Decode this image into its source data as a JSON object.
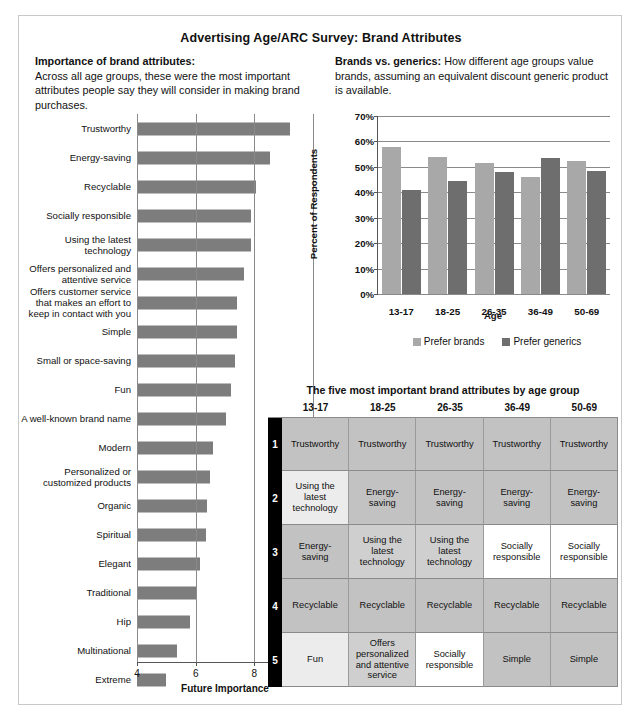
{
  "title": "Advertising Age/ARC Survey: Brand Attributes",
  "left_caption": {
    "lead": "Importance of brand attributes:",
    "body": "Across all age groups, these were the most important attributes people say they will consider in making brand purchases."
  },
  "right_caption": {
    "lead": "Brands vs. generics:",
    "body": " How different age groups value brands, assuming an equivalent discount generic product is available."
  },
  "colors": {
    "bar_gray": "#7d7d7d",
    "prefer_brands": "#a8a8a8",
    "prefer_generics": "#6e6e6e",
    "rank_column": "#000000",
    "grid": "#8a8a8a"
  },
  "chart_data": [
    {
      "type": "bar",
      "orientation": "horizontal",
      "title": "Importance of brand attributes",
      "xlabel": "Future Importance",
      "ylabel": "",
      "xlim": [
        4,
        10
      ],
      "xticks": [
        4,
        6,
        8,
        10
      ],
      "grid": true,
      "categories": [
        "Trustworthy",
        "Energy-saving",
        "Recyclable",
        "Socially responsible",
        "Using the latest\ntechnology",
        "Offers personalized and\nattentive service",
        "Offers customer service\nthat makes an effort to\nkeep in contact with you",
        "Simple",
        "Small or space-saving",
        "Fun",
        "A well-known brand name",
        "Modern",
        "Personalized or\ncustomized products",
        "Organic",
        "Spiritual",
        "Elegant",
        "Traditional",
        "Hip",
        "Multinational",
        "Extreme"
      ],
      "values": [
        9.2,
        8.55,
        8.05,
        7.9,
        7.9,
        7.65,
        7.4,
        7.4,
        7.35,
        7.2,
        7.05,
        6.6,
        6.5,
        6.4,
        6.35,
        6.15,
        6.0,
        5.8,
        5.35,
        5.0
      ]
    },
    {
      "type": "bar",
      "orientation": "vertical",
      "title": "Brands vs. generics",
      "xlabel": "Age",
      "ylabel": "Percent of Respondents",
      "ylim": [
        0,
        70
      ],
      "yticks": [
        "0%",
        "10%",
        "20%",
        "30%",
        "40%",
        "50%",
        "60%",
        "70%"
      ],
      "grid": true,
      "legend_position": "bottom",
      "categories": [
        "13-17",
        "18-25",
        "26-35",
        "36-49",
        "50-69"
      ],
      "series": [
        {
          "name": "Prefer brands",
          "values": [
            58,
            54,
            51.5,
            46,
            52.5
          ]
        },
        {
          "name": "Prefer generics",
          "values": [
            41,
            44.5,
            48,
            53.5,
            48.5
          ]
        }
      ]
    }
  ],
  "table": {
    "title": "The five most important brand attributes by age group",
    "columns": [
      "13-17",
      "18-25",
      "26-35",
      "36-49",
      "50-69"
    ],
    "ranks": [
      "1",
      "2",
      "3",
      "4",
      "5"
    ],
    "rows": [
      [
        {
          "text": "Trustworthy",
          "shade": "sh-dark"
        },
        {
          "text": "Trustworthy",
          "shade": "sh-dark"
        },
        {
          "text": "Trustworthy",
          "shade": "sh-dark"
        },
        {
          "text": "Trustworthy",
          "shade": "sh-dark"
        },
        {
          "text": "Trustworthy",
          "shade": "sh-dark"
        }
      ],
      [
        {
          "text": "Using the\nlatest\ntechnology",
          "shade": "sh-light"
        },
        {
          "text": "Energy-\nsaving",
          "shade": "sh-dark"
        },
        {
          "text": "Energy-\nsaving",
          "shade": "sh-dark"
        },
        {
          "text": "Energy-\nsaving",
          "shade": "sh-dark"
        },
        {
          "text": "Energy-\nsaving",
          "shade": "sh-dark"
        }
      ],
      [
        {
          "text": "Energy-\nsaving",
          "shade": "sh-dark"
        },
        {
          "text": "Using the\nlatest\ntechnology",
          "shade": "sh-mid"
        },
        {
          "text": "Using the\nlatest\ntechnology",
          "shade": "sh-mid"
        },
        {
          "text": "Socially\nresponsible",
          "shade": "sh-white"
        },
        {
          "text": "Socially\nresponsible",
          "shade": "sh-white"
        }
      ],
      [
        {
          "text": "Recyclable",
          "shade": "sh-dark"
        },
        {
          "text": "Recyclable",
          "shade": "sh-dark"
        },
        {
          "text": "Recyclable",
          "shade": "sh-dark"
        },
        {
          "text": "Recyclable",
          "shade": "sh-dark"
        },
        {
          "text": "Recyclable",
          "shade": "sh-dark"
        }
      ],
      [
        {
          "text": "Fun",
          "shade": "sh-light"
        },
        {
          "text": "Offers\npersonalized\nand attentive\nservice",
          "shade": "sh-mid"
        },
        {
          "text": "Socially\nresponsible",
          "shade": "sh-white"
        },
        {
          "text": "Simple",
          "shade": "sh-dark"
        },
        {
          "text": "Simple",
          "shade": "sh-dark"
        }
      ]
    ]
  }
}
